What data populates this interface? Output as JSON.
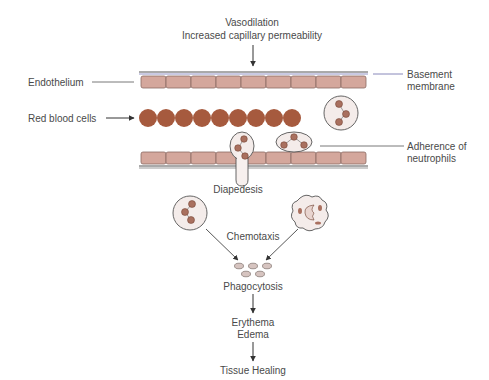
{
  "title_top": {
    "line1": "Vasodilation",
    "line2": "Increased capillary permeability"
  },
  "labels": {
    "endothelium": "Endothelium",
    "basement_line1": "Basement",
    "basement_line2": "membrane",
    "red_blood_cells": "Red blood cells",
    "adherence_line1": "Adherence of",
    "adherence_line2": "neutrophils",
    "diapedesis": "Diapedesis",
    "chemotaxis": "Chemotaxis",
    "phagocytosis": "Phagocytosis",
    "erythema": "Erythema",
    "edema": "Edema",
    "tissue_healing": "Tissue Healing"
  },
  "colors": {
    "endothelial_cell": "#d4a79c",
    "endothelial_stroke": "#8a6a62",
    "rbc": "#a65a3e",
    "nucleus": "#a9705f",
    "cell_body": "#f4ecea",
    "basement_membrane": "#6a6aa8",
    "text": "#4a4a4a"
  }
}
